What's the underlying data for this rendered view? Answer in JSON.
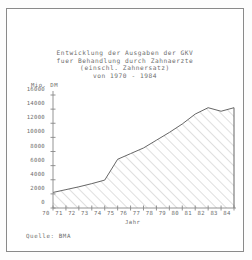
{
  "window": {
    "background_color": "#fdfdfd",
    "border_color": "#8a8a8a"
  },
  "source_note": "Quelle: BMA",
  "chart_data": {
    "type": "area",
    "title": "Entwicklung der Ausgaben der GKV",
    "title_lines": [
      "Entwicklung der Ausgaben der GKV",
      "fuer Behandlung durch Zahnaerzte",
      "(einschl. Zahnersatz)",
      "von 1970 - 1984"
    ],
    "xlabel": "Jahr",
    "ylabel": "Mio. DM",
    "ylim": [
      0,
      16000
    ],
    "xlim": [
      70,
      84
    ],
    "grid": false,
    "legend": null,
    "line_color": "#555555",
    "fill_pattern": "diagonal-hatch",
    "fill_color": "#b9b9b9",
    "axis_color": "#888888",
    "ytick_labels": [
      "16000",
      "14000",
      "12000",
      "10000",
      "8000",
      "6000",
      "4000",
      "2000",
      "0"
    ],
    "ytick_values": [
      16000,
      14000,
      12000,
      10000,
      8000,
      6000,
      4000,
      2000,
      0
    ],
    "xtick_labels": [
      "70",
      "71",
      "72",
      "73",
      "74",
      "75",
      "76",
      "77",
      "78",
      "79",
      "80",
      "81",
      "82",
      "83",
      "84"
    ],
    "categories": [
      1970,
      1971,
      1972,
      1973,
      1974,
      1975,
      1976,
      1977,
      1978,
      1979,
      1980,
      1981,
      1982,
      1983,
      1984
    ],
    "values": [
      2200,
      2600,
      3000,
      3450,
      3950,
      6900,
      7700,
      8500,
      9600,
      10700,
      11900,
      13300,
      14200,
      13700,
      14200
    ],
    "series": [
      {
        "name": "Ausgaben der GKV fuer Behandlung durch Zahnaerzte",
        "unit": "Mio. DM",
        "values": [
          2200,
          2600,
          3000,
          3450,
          3950,
          6900,
          7700,
          8500,
          9600,
          10700,
          11900,
          13300,
          14200,
          13700,
          14200
        ]
      }
    ]
  }
}
